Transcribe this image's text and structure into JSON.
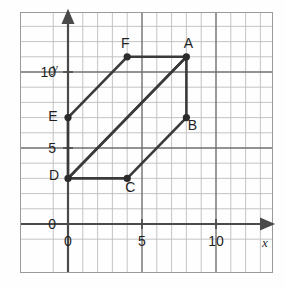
{
  "figure": {
    "kind": "coordinate-grid-plot",
    "background_color": "#fefefe",
    "border_color": "#9a9a9a"
  },
  "chart_data": {
    "type": "scatter",
    "title": "",
    "xlabel": "x",
    "ylabel": "y",
    "xlim": [
      -1.5,
      13.5
    ],
    "ylim": [
      -1.5,
      14
    ],
    "grid": true,
    "grid_minor_step": 1,
    "grid_major_step": 5,
    "legend": "none",
    "x_tick_labels": [
      "0",
      "5",
      "10"
    ],
    "x_tick_values": [
      0,
      5,
      10
    ],
    "y_tick_labels": [
      "0",
      "5",
      "10"
    ],
    "y_tick_values": [
      0,
      5,
      10
    ],
    "points": [
      {
        "label": "A",
        "x": 8,
        "y": 11,
        "label_dx": 2,
        "label_dy": -9
      },
      {
        "label": "B",
        "x": 8,
        "y": 7,
        "label_dx": 6,
        "label_dy": 12
      },
      {
        "label": "C",
        "x": 4,
        "y": 3,
        "label_dx": 3,
        "label_dy": 14
      },
      {
        "label": "D",
        "x": 0,
        "y": 3,
        "label_dx": -14,
        "label_dy": 2
      },
      {
        "label": "E",
        "x": 0,
        "y": 7,
        "label_dx": -15,
        "label_dy": 3
      },
      {
        "label": "F",
        "x": 4,
        "y": 11,
        "label_dx": -2,
        "label_dy": -9
      }
    ],
    "polylines": [
      {
        "name": "parallelogram-ABCD",
        "vertices": [
          "A",
          "B",
          "C",
          "D"
        ],
        "closed": true
      },
      {
        "name": "parallelogram-ADEF",
        "vertices": [
          "A",
          "D",
          "E",
          "F"
        ],
        "closed": true
      }
    ],
    "series": [
      {
        "name": "vertices",
        "x": [
          8,
          8,
          4,
          0,
          0,
          4
        ],
        "y": [
          11,
          7,
          3,
          3,
          7,
          11
        ],
        "labels": [
          "A",
          "B",
          "C",
          "D",
          "E",
          "F"
        ]
      }
    ],
    "colors": {
      "shape_stroke": "#3a3a3a",
      "point_fill": "#2b2b2b",
      "axis": "#4a4a4a",
      "grid_minor": "#bdbdbd",
      "grid_major": "#6f6f6f"
    }
  },
  "axes": {
    "x_axis_label": "x",
    "y_axis_label": "y",
    "origin_label_y": "0",
    "origin_label_x": "0"
  }
}
